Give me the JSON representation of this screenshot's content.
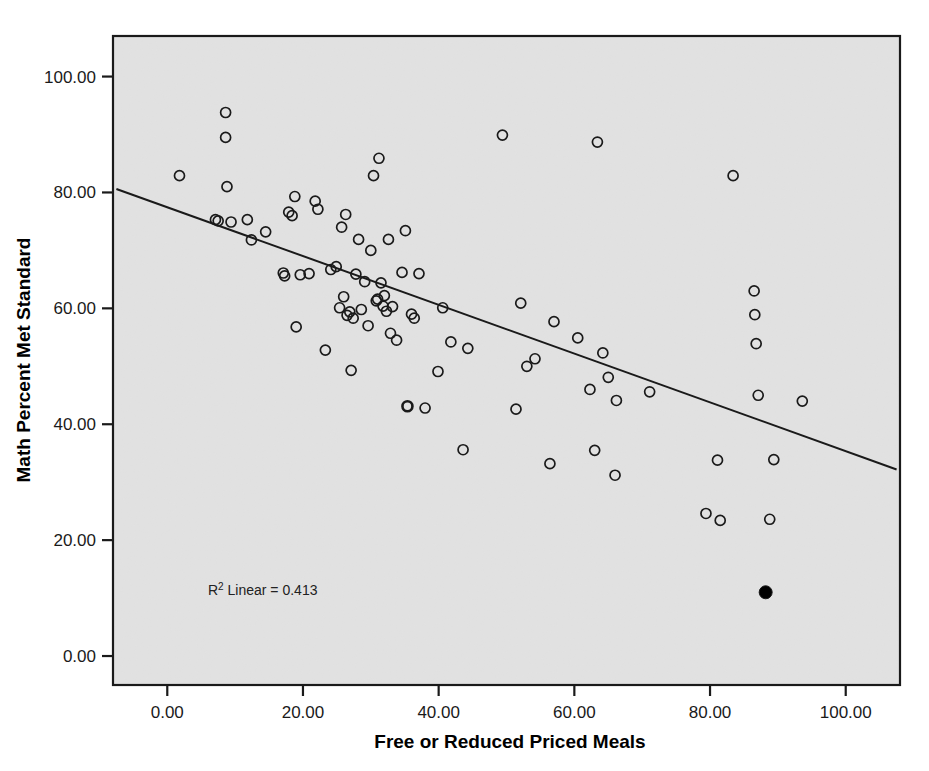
{
  "chart_data": {
    "type": "scatter",
    "title": "",
    "xlabel": "Free or Reduced Priced Meals",
    "ylabel": "Math Percent Met Standard",
    "xlim": [
      -8,
      108
    ],
    "ylim": [
      -5,
      107
    ],
    "xticks": [
      0,
      20,
      40,
      60,
      80,
      100
    ],
    "xticklabels": [
      "0.00",
      "20.00",
      "40.00",
      "60.00",
      "80.00",
      "100.00"
    ],
    "yticks": [
      0,
      20,
      40,
      60,
      80,
      100
    ],
    "yticklabels": [
      "0.00",
      "20.00",
      "40.00",
      "60.00",
      "80.00",
      "100.00"
    ],
    "grid": false,
    "legend": null,
    "annotations": [
      {
        "name": "r-squared-annotation",
        "text_prefix": "R",
        "text_superscript": "2",
        "text_suffix": " Linear = 0.413",
        "full_text": "R² Linear = 0.413",
        "x": 6,
        "y": 10.5
      }
    ],
    "fit_line": {
      "type": "linear",
      "r_squared": 0.413,
      "x_start": -7.5,
      "y_start": 80.6,
      "x_end": 107.5,
      "y_end": 32.2,
      "slope": -0.421,
      "intercept": 77.4,
      "color": "#1a1a1a"
    },
    "marker": {
      "shape": "circle",
      "open_fill": "none",
      "edge_color": "#1a1a1a",
      "highlight_fill": "#000000",
      "radius_px": 5
    },
    "points": [
      {
        "x": 1.8,
        "y": 82.9,
        "style": "open"
      },
      {
        "x": 7.1,
        "y": 75.3,
        "style": "open"
      },
      {
        "x": 7.5,
        "y": 75.1,
        "style": "open"
      },
      {
        "x": 8.6,
        "y": 93.8,
        "style": "open"
      },
      {
        "x": 8.6,
        "y": 89.5,
        "style": "open"
      },
      {
        "x": 8.8,
        "y": 81.0,
        "style": "open"
      },
      {
        "x": 9.4,
        "y": 74.9,
        "style": "open"
      },
      {
        "x": 11.8,
        "y": 75.3,
        "style": "open"
      },
      {
        "x": 12.4,
        "y": 71.8,
        "style": "open"
      },
      {
        "x": 14.5,
        "y": 73.2,
        "style": "open"
      },
      {
        "x": 17.1,
        "y": 66.1,
        "style": "open"
      },
      {
        "x": 17.3,
        "y": 65.6,
        "style": "open"
      },
      {
        "x": 17.9,
        "y": 76.6,
        "style": "open"
      },
      {
        "x": 18.4,
        "y": 76.0,
        "style": "open"
      },
      {
        "x": 18.8,
        "y": 79.3,
        "style": "open"
      },
      {
        "x": 19.0,
        "y": 56.8,
        "style": "open"
      },
      {
        "x": 19.6,
        "y": 65.8,
        "style": "open"
      },
      {
        "x": 20.9,
        "y": 66.0,
        "style": "open"
      },
      {
        "x": 21.8,
        "y": 78.5,
        "style": "open"
      },
      {
        "x": 22.2,
        "y": 77.1,
        "style": "open"
      },
      {
        "x": 23.3,
        "y": 52.8,
        "style": "open"
      },
      {
        "x": 24.1,
        "y": 66.7,
        "style": "open"
      },
      {
        "x": 24.9,
        "y": 67.2,
        "style": "open"
      },
      {
        "x": 25.4,
        "y": 60.1,
        "style": "open"
      },
      {
        "x": 25.7,
        "y": 74.0,
        "style": "open"
      },
      {
        "x": 26.0,
        "y": 62.0,
        "style": "open"
      },
      {
        "x": 26.3,
        "y": 76.2,
        "style": "open"
      },
      {
        "x": 26.5,
        "y": 58.8,
        "style": "open"
      },
      {
        "x": 26.9,
        "y": 59.4,
        "style": "open"
      },
      {
        "x": 27.1,
        "y": 49.3,
        "style": "open"
      },
      {
        "x": 27.4,
        "y": 58.3,
        "style": "open"
      },
      {
        "x": 27.8,
        "y": 65.9,
        "style": "open"
      },
      {
        "x": 28.2,
        "y": 71.9,
        "style": "open"
      },
      {
        "x": 28.6,
        "y": 59.8,
        "style": "open"
      },
      {
        "x": 29.1,
        "y": 64.6,
        "style": "open"
      },
      {
        "x": 29.6,
        "y": 57.0,
        "style": "open"
      },
      {
        "x": 30.0,
        "y": 70.0,
        "style": "open"
      },
      {
        "x": 30.4,
        "y": 82.9,
        "style": "open"
      },
      {
        "x": 30.8,
        "y": 61.3,
        "style": "open"
      },
      {
        "x": 31.0,
        "y": 61.6,
        "style": "open"
      },
      {
        "x": 31.2,
        "y": 85.9,
        "style": "open"
      },
      {
        "x": 31.5,
        "y": 64.4,
        "style": "open"
      },
      {
        "x": 31.8,
        "y": 60.4,
        "style": "open"
      },
      {
        "x": 32.0,
        "y": 62.2,
        "style": "open"
      },
      {
        "x": 32.3,
        "y": 59.5,
        "style": "open"
      },
      {
        "x": 32.6,
        "y": 71.9,
        "style": "open"
      },
      {
        "x": 32.9,
        "y": 55.7,
        "style": "open"
      },
      {
        "x": 33.2,
        "y": 60.3,
        "style": "open"
      },
      {
        "x": 33.8,
        "y": 54.5,
        "style": "open"
      },
      {
        "x": 34.6,
        "y": 66.2,
        "style": "open"
      },
      {
        "x": 35.1,
        "y": 73.4,
        "style": "open"
      },
      {
        "x": 35.4,
        "y": 43.1,
        "style": "highlight-open"
      },
      {
        "x": 36.0,
        "y": 59.0,
        "style": "open"
      },
      {
        "x": 36.4,
        "y": 58.3,
        "style": "open"
      },
      {
        "x": 37.1,
        "y": 66.0,
        "style": "open"
      },
      {
        "x": 38.0,
        "y": 42.8,
        "style": "open"
      },
      {
        "x": 39.9,
        "y": 49.1,
        "style": "open"
      },
      {
        "x": 40.6,
        "y": 60.1,
        "style": "open"
      },
      {
        "x": 41.8,
        "y": 54.2,
        "style": "open"
      },
      {
        "x": 43.6,
        "y": 35.6,
        "style": "open"
      },
      {
        "x": 44.3,
        "y": 53.1,
        "style": "open"
      },
      {
        "x": 49.4,
        "y": 89.9,
        "style": "open"
      },
      {
        "x": 51.4,
        "y": 42.6,
        "style": "open"
      },
      {
        "x": 52.1,
        "y": 60.9,
        "style": "open"
      },
      {
        "x": 53.0,
        "y": 50.0,
        "style": "open"
      },
      {
        "x": 54.2,
        "y": 51.3,
        "style": "open"
      },
      {
        "x": 56.4,
        "y": 33.2,
        "style": "open"
      },
      {
        "x": 57.0,
        "y": 57.7,
        "style": "open"
      },
      {
        "x": 60.5,
        "y": 54.9,
        "style": "open"
      },
      {
        "x": 62.3,
        "y": 46.0,
        "style": "open"
      },
      {
        "x": 63.0,
        "y": 35.5,
        "style": "open"
      },
      {
        "x": 63.4,
        "y": 88.7,
        "style": "open"
      },
      {
        "x": 64.2,
        "y": 52.3,
        "style": "open"
      },
      {
        "x": 65.0,
        "y": 48.1,
        "style": "open"
      },
      {
        "x": 66.0,
        "y": 31.2,
        "style": "open"
      },
      {
        "x": 66.2,
        "y": 44.1,
        "style": "open"
      },
      {
        "x": 71.1,
        "y": 45.6,
        "style": "open"
      },
      {
        "x": 79.4,
        "y": 24.6,
        "style": "open"
      },
      {
        "x": 81.1,
        "y": 33.8,
        "style": "open"
      },
      {
        "x": 81.5,
        "y": 23.4,
        "style": "open"
      },
      {
        "x": 83.4,
        "y": 82.9,
        "style": "open"
      },
      {
        "x": 86.5,
        "y": 63.0,
        "style": "open"
      },
      {
        "x": 86.6,
        "y": 58.9,
        "style": "open"
      },
      {
        "x": 86.8,
        "y": 53.9,
        "style": "open"
      },
      {
        "x": 87.1,
        "y": 45.0,
        "style": "open"
      },
      {
        "x": 88.2,
        "y": 11.0,
        "style": "filled"
      },
      {
        "x": 88.8,
        "y": 23.6,
        "style": "open"
      },
      {
        "x": 89.4,
        "y": 33.9,
        "style": "open"
      },
      {
        "x": 93.6,
        "y": 44.0,
        "style": "open"
      }
    ]
  },
  "colors": {
    "plot_background": "#ededed",
    "frame": "#1a1a1a",
    "text": "#000000",
    "marker_edge": "#1a1a1a",
    "marker_filled": "#000000",
    "fit_line": "#1a1a1a"
  }
}
